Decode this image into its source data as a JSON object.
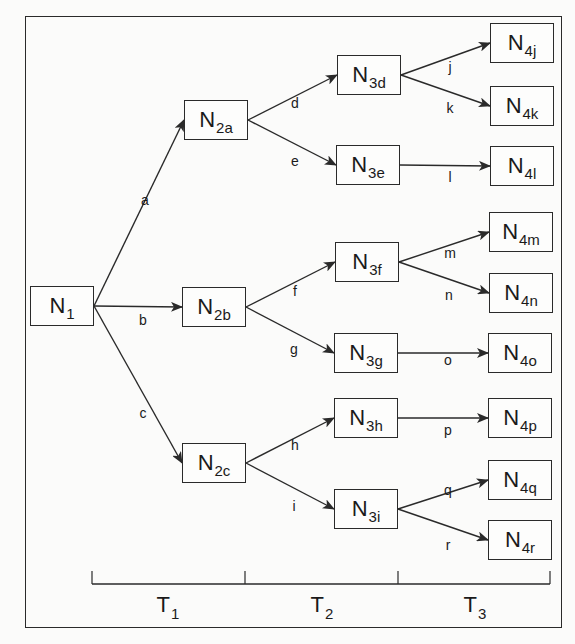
{
  "diagram": {
    "type": "decision-tree",
    "nodes": [
      {
        "id": "N1",
        "main": "N",
        "sub": "1",
        "x": 30,
        "y": 286
      },
      {
        "id": "N2a",
        "main": "N",
        "sub": "2a",
        "x": 184,
        "y": 100
      },
      {
        "id": "N2b",
        "main": "N",
        "sub": "2b",
        "x": 182,
        "y": 287
      },
      {
        "id": "N2c",
        "main": "N",
        "sub": "2c",
        "x": 182,
        "y": 443
      },
      {
        "id": "N3d",
        "main": "N",
        "sub": "3d",
        "x": 337,
        "y": 55
      },
      {
        "id": "N3e",
        "main": "N",
        "sub": "3e",
        "x": 336,
        "y": 145
      },
      {
        "id": "N3f",
        "main": "N",
        "sub": "3f",
        "x": 335,
        "y": 242
      },
      {
        "id": "N3g",
        "main": "N",
        "sub": "3g",
        "x": 334,
        "y": 333
      },
      {
        "id": "N3h",
        "main": "N",
        "sub": "3h",
        "x": 334,
        "y": 398
      },
      {
        "id": "N3i",
        "main": "N",
        "sub": "3i",
        "x": 334,
        "y": 489
      },
      {
        "id": "N4j",
        "main": "N",
        "sub": "4j",
        "x": 490,
        "y": 23
      },
      {
        "id": "N4k",
        "main": "N",
        "sub": "4k",
        "x": 490,
        "y": 86
      },
      {
        "id": "N4l",
        "main": "N",
        "sub": "4l",
        "x": 490,
        "y": 146
      },
      {
        "id": "N4m",
        "main": "N",
        "sub": "4m",
        "x": 489,
        "y": 212
      },
      {
        "id": "N4n",
        "main": "N",
        "sub": "4n",
        "x": 489,
        "y": 273
      },
      {
        "id": "N4o",
        "main": "N",
        "sub": "4o",
        "x": 488,
        "y": 333
      },
      {
        "id": "N4p",
        "main": "N",
        "sub": "4p",
        "x": 488,
        "y": 398
      },
      {
        "id": "N4q",
        "main": "N",
        "sub": "4q",
        "x": 488,
        "y": 460
      },
      {
        "id": "N4r",
        "main": "N",
        "sub": "4r",
        "x": 488,
        "y": 520
      }
    ],
    "edges": [
      {
        "label": "a",
        "from": "N1",
        "to": "N2a",
        "lx": 145,
        "ly": 200
      },
      {
        "label": "b",
        "from": "N1",
        "to": "N2b",
        "lx": 143,
        "ly": 320
      },
      {
        "label": "c",
        "from": "N1",
        "to": "N2c",
        "lx": 143,
        "ly": 413
      },
      {
        "label": "d",
        "from": "N2a",
        "to": "N3d",
        "lx": 295,
        "ly": 103
      },
      {
        "label": "e",
        "from": "N2a",
        "to": "N3e",
        "lx": 295,
        "ly": 161
      },
      {
        "label": "f",
        "from": "N2b",
        "to": "N3f",
        "lx": 295,
        "ly": 291
      },
      {
        "label": "g",
        "from": "N2b",
        "to": "N3g",
        "lx": 294,
        "ly": 349
      },
      {
        "label": "h",
        "from": "N2c",
        "to": "N3h",
        "lx": 295,
        "ly": 445
      },
      {
        "label": "i",
        "from": "N2c",
        "to": "N3i",
        "lx": 294,
        "ly": 506
      },
      {
        "label": "j",
        "from": "N3d",
        "to": "N4j",
        "lx": 450,
        "ly": 67
      },
      {
        "label": "k",
        "from": "N3d",
        "to": "N4k",
        "lx": 450,
        "ly": 108
      },
      {
        "label": "l",
        "from": "N3e",
        "to": "N4l",
        "lx": 450,
        "ly": 177
      },
      {
        "label": "m",
        "from": "N3f",
        "to": "N4m",
        "lx": 450,
        "ly": 253
      },
      {
        "label": "n",
        "from": "N3f",
        "to": "N4n",
        "lx": 449,
        "ly": 295
      },
      {
        "label": "o",
        "from": "N3g",
        "to": "N4o",
        "lx": 448,
        "ly": 360
      },
      {
        "label": "p",
        "from": "N3h",
        "to": "N4p",
        "lx": 448,
        "ly": 430
      },
      {
        "label": "q",
        "from": "N3i",
        "to": "N4q",
        "lx": 448,
        "ly": 490
      },
      {
        "label": "r",
        "from": "N3i",
        "to": "N4r",
        "lx": 448,
        "ly": 545
      }
    ],
    "timeline": {
      "y": 584,
      "ticks": [
        92,
        245,
        398,
        550
      ],
      "periods": [
        {
          "main": "T",
          "sub": "1",
          "x": 168
        },
        {
          "main": "T",
          "sub": "2",
          "x": 322
        },
        {
          "main": "T",
          "sub": "3",
          "x": 475
        }
      ],
      "label_y": 605
    }
  },
  "style": {
    "line_color": "#2a2a2a",
    "background": "#fbfbfa"
  }
}
